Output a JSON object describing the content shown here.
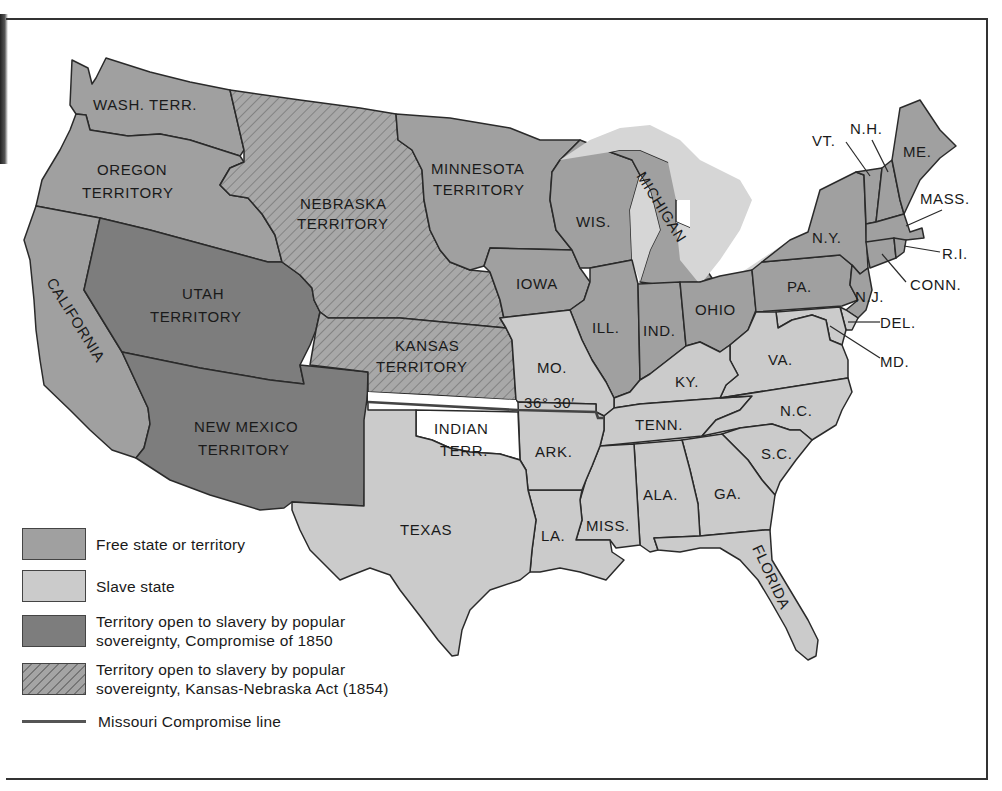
{
  "map": {
    "title": "",
    "colors": {
      "free": "#a0a0a0",
      "slave": "#cbcbcb",
      "popular_sovereignty_1850": "#7d7d7d",
      "kansas_nebraska_1854": "#a4a4a4 (hatched)",
      "unorganized": "#ffffff",
      "lakes": "#d8d8d8",
      "border": "#2a2a2a"
    },
    "regions": {
      "wash_terr": {
        "label": "WASH. TERR.",
        "status": "free"
      },
      "oregon": {
        "label1": "OREGON",
        "label2": "TERRITORY",
        "status": "free"
      },
      "california": {
        "label": "CALIFORNIA",
        "status": "free"
      },
      "utah": {
        "label1": "UTAH",
        "label2": "TERRITORY",
        "status": "popular_sovereignty_1850"
      },
      "new_mexico": {
        "label1": "NEW MEXICO",
        "label2": "TERRITORY",
        "status": "popular_sovereignty_1850"
      },
      "nebraska": {
        "label1": "NEBRASKA",
        "label2": "TERRITORY",
        "status": "kansas_nebraska_1854"
      },
      "kansas": {
        "label1": "KANSAS",
        "label2": "TERRITORY",
        "status": "kansas_nebraska_1854"
      },
      "minnesota": {
        "label1": "MINNESOTA",
        "label2": "TERRITORY",
        "status": "free"
      },
      "iowa": {
        "label": "IOWA",
        "status": "free"
      },
      "wisconsin": {
        "label": "WIS.",
        "status": "free"
      },
      "michigan": {
        "label": "MICHIGAN",
        "status": "free"
      },
      "illinois": {
        "label": "ILL.",
        "status": "free"
      },
      "indiana": {
        "label": "IND.",
        "status": "free"
      },
      "ohio": {
        "label": "OHIO",
        "status": "free"
      },
      "pennsylvania": {
        "label": "PA.",
        "status": "free"
      },
      "new_york": {
        "label": "N.Y.",
        "status": "free"
      },
      "new_jersey": {
        "label": "N.J.",
        "status": "free"
      },
      "vermont": {
        "label": "VT.",
        "status": "free"
      },
      "new_hampshire": {
        "label": "N.H.",
        "status": "free"
      },
      "maine": {
        "label": "ME.",
        "status": "free"
      },
      "massachusetts": {
        "label": "MASS.",
        "status": "free"
      },
      "rhode_island": {
        "label": "R.I.",
        "status": "free"
      },
      "connecticut": {
        "label": "CONN.",
        "status": "free"
      },
      "delaware": {
        "label": "DEL.",
        "status": "slave"
      },
      "maryland": {
        "label": "MD.",
        "status": "slave"
      },
      "virginia": {
        "label": "VA.",
        "status": "slave"
      },
      "kentucky": {
        "label": "KY.",
        "status": "slave"
      },
      "missouri": {
        "label": "MO.",
        "status": "slave"
      },
      "tennessee": {
        "label": "TENN.",
        "status": "slave"
      },
      "north_carolina": {
        "label": "N.C.",
        "status": "slave"
      },
      "south_carolina": {
        "label": "S.C.",
        "status": "slave"
      },
      "georgia": {
        "label": "GA.",
        "status": "slave"
      },
      "alabama": {
        "label": "ALA.",
        "status": "slave"
      },
      "mississippi": {
        "label": "MISS.",
        "status": "slave"
      },
      "louisiana": {
        "label": "LA.",
        "status": "slave"
      },
      "arkansas": {
        "label": "ARK.",
        "status": "slave"
      },
      "texas": {
        "label": "TEXAS",
        "status": "slave"
      },
      "florida": {
        "label": "FLORIDA",
        "status": "slave"
      },
      "indian_terr": {
        "label1": "INDIAN",
        "label2": "TERR.",
        "status": "unorganized"
      }
    },
    "compromise_line_label": "36° 30′"
  },
  "legend": {
    "items": [
      {
        "label": "Free state or territory",
        "swatch": "free"
      },
      {
        "label": "Slave state",
        "swatch": "slave"
      },
      {
        "label_line1": "Territory open to slavery by popular",
        "label_line2": "sovereignty, Compromise of 1850",
        "swatch": "popular_sovereignty_1850"
      },
      {
        "label_line1": "Territory open to slavery by popular",
        "label_line2": "sovereignty, Kansas-Nebraska Act (1854)",
        "swatch": "kansas_nebraska_1854"
      },
      {
        "label": "Missouri Compromise line",
        "swatch": "line"
      }
    ]
  }
}
